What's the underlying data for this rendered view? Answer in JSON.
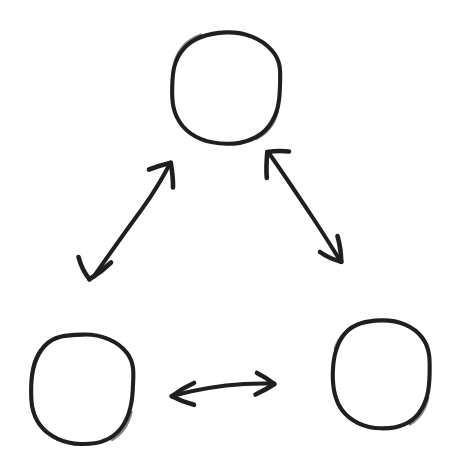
{
  "diagram": {
    "title": "Three nodes connected by bidirectional arrows",
    "style": "hand-drawn sketch",
    "background_color": "#ffffff",
    "stroke_color": "#1f1f1f",
    "canvas": {
      "width": 457,
      "height": 464
    },
    "nodes": [
      {
        "id": "node-top",
        "name": "top-circle",
        "label": "",
        "shape": "circle",
        "center_x": 226,
        "center_y": 88,
        "radius_x": 54,
        "radius_y": 56
      },
      {
        "id": "node-bottom-left",
        "name": "bottom-left-circle",
        "label": "",
        "shape": "circle",
        "center_x": 82,
        "center_y": 389,
        "radius_x": 51,
        "radius_y": 55
      },
      {
        "id": "node-bottom-right",
        "name": "bottom-right-circle",
        "label": "",
        "shape": "circle",
        "center_x": 381,
        "center_y": 374,
        "radius_x": 49,
        "radius_y": 54
      }
    ],
    "connectors": [
      {
        "id": "connector-left",
        "name": "arrow-top-to-bottom-left",
        "label": "",
        "from": "node-bottom-left",
        "to": "node-top",
        "direction": "bidirectional",
        "start_x": 91,
        "start_y": 280,
        "end_x": 170,
        "end_y": 163
      },
      {
        "id": "connector-right",
        "name": "arrow-top-to-bottom-right",
        "label": "",
        "from": "node-top",
        "to": "node-bottom-right",
        "direction": "bidirectional",
        "start_x": 268,
        "start_y": 151,
        "end_x": 341,
        "end_y": 261
      },
      {
        "id": "connector-bottom",
        "name": "arrow-bottom-left-to-bottom-right",
        "label": "",
        "from": "node-bottom-left",
        "to": "node-bottom-right",
        "direction": "bidirectional",
        "start_x": 172,
        "start_y": 396,
        "end_x": 274,
        "end_y": 384
      }
    ]
  }
}
